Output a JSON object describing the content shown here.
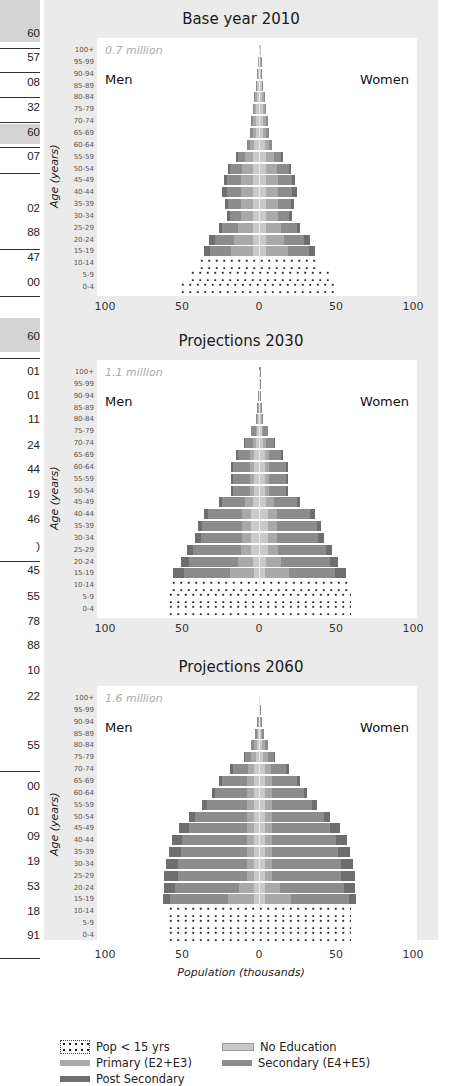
{
  "left_column": {
    "values": [
      "60",
      "57",
      "08",
      "32",
      "60",
      "07",
      "02",
      "88",
      "47",
      "00",
      "60",
      "01",
      "01",
      "11",
      "24",
      "44",
      "19",
      "46",
      ")",
      "45",
      "55",
      "78",
      "88",
      "10",
      "22",
      "55",
      "00",
      "01",
      "09",
      "19",
      "53",
      "18",
      "91"
    ]
  },
  "axis": {
    "age_label": "Age (years)",
    "age_groups": [
      "100+",
      "95-99",
      "90-94",
      "85-89",
      "80-84",
      "75-79",
      "70-74",
      "65-69",
      "60-64",
      "55-59",
      "50-54",
      "45-49",
      "40-44",
      "35-39",
      "30-34",
      "25-29",
      "20-24",
      "15-19",
      "10-14",
      "5-9",
      "0-4"
    ],
    "x_ticks": [
      "100",
      "50",
      "0",
      "50",
      "100"
    ],
    "x_label": "Population (thousands)",
    "men_label": "Men",
    "women_label": "Women"
  },
  "legend": {
    "pop15": "Pop < 15 yrs",
    "noed": "No Education",
    "prim": "Primary (E2+E3)",
    "sec": "Secondary (E4+E5)",
    "post": "Post Secondary"
  },
  "colors": {
    "no_education": "#c9c9c9",
    "primary": "#a9a9a9",
    "secondary": "#8c8c8c",
    "post_secondary": "#6e6e6e",
    "panel_bg": "#ebebeb"
  },
  "charts": [
    {
      "title": "Base year 2010",
      "total": "0.7 million"
    },
    {
      "title": "Projections 2030",
      "total": "1.1 million"
    },
    {
      "title": "Projections 2060",
      "total": "1.6 million"
    }
  ],
  "chart_data": [
    {
      "type": "bar",
      "subtype": "population-pyramid",
      "title": "Base year 2010",
      "annotation": "0.7 million",
      "xlabel": "Population (thousands)",
      "ylabel": "Age (years)",
      "xlim": [
        -100,
        100
      ],
      "categories": [
        "0-4",
        "5-9",
        "10-14",
        "15-19",
        "20-24",
        "25-29",
        "30-34",
        "35-39",
        "40-44",
        "45-49",
        "50-54",
        "55-59",
        "60-64",
        "65-69",
        "70-74",
        "75-79",
        "80-84",
        "85-89",
        "90-94",
        "95-99",
        "100+"
      ],
      "series": [
        {
          "name": "Men total",
          "values": [
            52,
            46,
            40,
            36,
            33,
            26,
            21,
            22,
            24,
            23,
            20,
            15,
            8,
            6,
            5,
            4,
            3,
            2,
            1,
            0.5,
            0.2
          ]
        },
        {
          "name": "Women total",
          "values": [
            52,
            46,
            40,
            36,
            33,
            26,
            21,
            22,
            24,
            23,
            20,
            15,
            8,
            6,
            5,
            4,
            3,
            2,
            1,
            0.5,
            0.2
          ]
        },
        {
          "name": "No Education (each side)",
          "values": [
            0,
            0,
            0,
            4,
            4,
            4,
            4,
            4,
            4,
            4,
            4,
            4,
            3,
            2,
            2,
            2,
            1.5,
            1,
            0.5,
            0.3,
            0.1
          ]
        },
        {
          "name": "Primary (each side)",
          "values": [
            0,
            0,
            0,
            14,
            12,
            10,
            8,
            8,
            8,
            8,
            7,
            5,
            3,
            2,
            2,
            1,
            1,
            0.5,
            0.3,
            0.1,
            0.05
          ]
        },
        {
          "name": "Secondary (each side)",
          "values": [
            0,
            0,
            0,
            14,
            13,
            10,
            7,
            8,
            9,
            9,
            8,
            5,
            2,
            2,
            1,
            1,
            0.5,
            0.5,
            0.2,
            0.1,
            0.05
          ]
        },
        {
          "name": "Post Secondary (each side)",
          "values": [
            0,
            0,
            0,
            4,
            4,
            2,
            2,
            2,
            3,
            2,
            1,
            1,
            0,
            0,
            0,
            0,
            0,
            0,
            0,
            0,
            0
          ]
        }
      ],
      "legend": [
        "Pop < 15 yrs",
        "No Education",
        "Primary (E2+E3)",
        "Secondary (E4+E5)",
        "Post Secondary"
      ]
    },
    {
      "type": "bar",
      "subtype": "population-pyramid",
      "title": "Projections 2030",
      "annotation": "1.1 million",
      "xlabel": "Population (thousands)",
      "ylabel": "Age (years)",
      "xlim": [
        -100,
        100
      ],
      "categories": [
        "0-4",
        "5-9",
        "10-14",
        "15-19",
        "20-24",
        "25-29",
        "30-34",
        "35-39",
        "40-44",
        "45-49",
        "50-54",
        "55-59",
        "60-64",
        "65-69",
        "70-74",
        "75-79",
        "80-84",
        "85-89",
        "90-94",
        "95-99",
        "100+"
      ],
      "series": [
        {
          "name": "Men total",
          "values": [
            60,
            60,
            58,
            56,
            51,
            47,
            42,
            40,
            36,
            26,
            18,
            18,
            18,
            15,
            10,
            5,
            2,
            1,
            0.5,
            0.2,
            0.1
          ]
        },
        {
          "name": "Women total",
          "values": [
            60,
            60,
            58,
            56,
            51,
            47,
            42,
            40,
            36,
            26,
            18,
            18,
            18,
            15,
            10,
            5,
            2,
            1,
            0.5,
            0.2,
            0.1
          ]
        },
        {
          "name": "No Education (each side)",
          "values": [
            0,
            0,
            0,
            3,
            4,
            5,
            5,
            5,
            5,
            4,
            3,
            3,
            3,
            3,
            2,
            1,
            0.5,
            0.3,
            0.1,
            0.05,
            0
          ]
        },
        {
          "name": "Primary (each side)",
          "values": [
            0,
            0,
            0,
            16,
            10,
            7,
            6,
            6,
            6,
            5,
            3,
            3,
            3,
            3,
            2,
            1,
            0.5,
            0.2,
            0.1,
            0.05,
            0
          ]
        },
        {
          "name": "Secondary (each side)",
          "values": [
            0,
            0,
            0,
            30,
            32,
            31,
            27,
            26,
            22,
            15,
            11,
            11,
            11,
            8,
            5,
            3,
            1,
            0.5,
            0.3,
            0.1,
            0.1
          ]
        },
        {
          "name": "Post Secondary (each side)",
          "values": [
            0,
            0,
            0,
            7,
            5,
            4,
            4,
            3,
            3,
            2,
            1,
            1,
            1,
            1,
            1,
            0,
            0,
            0,
            0,
            0,
            0
          ]
        }
      ],
      "legend": [
        "Pop < 15 yrs",
        "No Education",
        "Primary (E2+E3)",
        "Secondary (E4+E5)",
        "Post Secondary"
      ]
    },
    {
      "type": "bar",
      "subtype": "population-pyramid",
      "title": "Projections 2060",
      "annotation": "1.6 million",
      "xlabel": "Population (thousands)",
      "ylabel": "Age (years)",
      "xlim": [
        -100,
        100
      ],
      "categories": [
        "0-4",
        "5-9",
        "10-14",
        "15-19",
        "20-24",
        "25-29",
        "30-34",
        "35-39",
        "40-44",
        "45-49",
        "50-54",
        "55-59",
        "60-64",
        "65-69",
        "70-74",
        "75-79",
        "80-84",
        "85-89",
        "90-94",
        "95-99",
        "100+"
      ],
      "series": [
        {
          "name": "Men total",
          "values": [
            60,
            60,
            60,
            63,
            62,
            62,
            61,
            59,
            57,
            52,
            46,
            37,
            31,
            26,
            19,
            10,
            5,
            3,
            1,
            0.3,
            0.1
          ]
        },
        {
          "name": "Women total",
          "values": [
            60,
            60,
            60,
            63,
            62,
            62,
            61,
            59,
            57,
            52,
            46,
            37,
            31,
            26,
            19,
            10,
            5,
            3,
            1,
            0.3,
            0.1
          ]
        },
        {
          "name": "No Education (each side)",
          "values": [
            0,
            0,
            0,
            3,
            3,
            3,
            3,
            3,
            3,
            3,
            3,
            3,
            3,
            3,
            3,
            2,
            1,
            0.5,
            0.3,
            0.1,
            0
          ]
        },
        {
          "name": "Primary (each side)",
          "values": [
            0,
            0,
            0,
            17,
            10,
            5,
            5,
            5,
            5,
            5,
            5,
            5,
            5,
            5,
            4,
            3,
            2,
            1,
            0.5,
            0.1,
            0.05
          ]
        },
        {
          "name": "Secondary (each side)",
          "values": [
            0,
            0,
            0,
            38,
            42,
            45,
            45,
            43,
            42,
            38,
            34,
            26,
            21,
            16,
            10,
            4,
            2,
            1,
            0.2,
            0.1,
            0.05
          ]
        },
        {
          "name": "Post Secondary (each side)",
          "values": [
            0,
            0,
            0,
            5,
            7,
            9,
            8,
            8,
            7,
            6,
            4,
            3,
            2,
            2,
            2,
            1,
            0,
            0,
            0,
            0,
            0
          ]
        }
      ],
      "legend": [
        "Pop < 15 yrs",
        "No Education",
        "Primary (E2+E3)",
        "Secondary (E4+E5)",
        "Post Secondary"
      ]
    }
  ]
}
